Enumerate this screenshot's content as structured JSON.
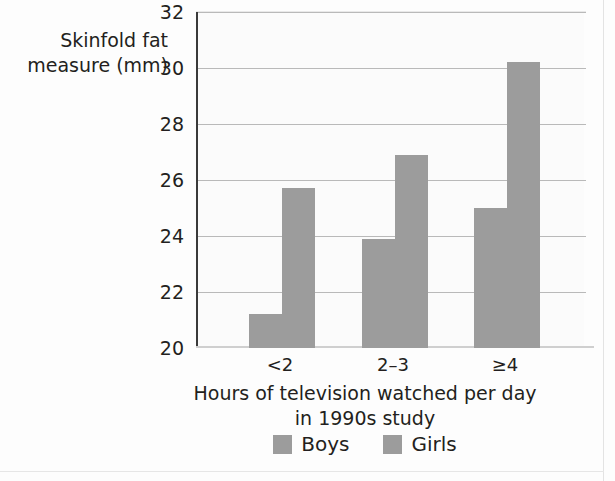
{
  "chart_data": {
    "type": "bar",
    "title": "",
    "categories": [
      "<2",
      "2–3",
      "≥4"
    ],
    "series": [
      {
        "name": "Boys",
        "values": [
          21.2,
          23.9,
          25.0
        ],
        "color": "#9c9c9c"
      },
      {
        "name": "Girls",
        "values": [
          25.7,
          26.9,
          30.2
        ],
        "color": "#9c9c9c"
      }
    ],
    "ylabel_line1": "Skinfold fat",
    "ylabel_line2": "measure (mm)",
    "xlabel_line1": "Hours of television watched per day",
    "xlabel_line2": "in 1990s study",
    "ylim": [
      20,
      32
    ],
    "ytick_labels": [
      "32",
      "30",
      "28",
      "26",
      "24",
      "22",
      "20"
    ],
    "ytick_values": [
      32,
      30,
      28,
      26,
      24,
      22,
      20
    ],
    "grid": true,
    "legend_position": "bottom-center"
  },
  "legend": {
    "items": [
      {
        "label": "Boys"
      },
      {
        "label": "Girls"
      }
    ]
  }
}
